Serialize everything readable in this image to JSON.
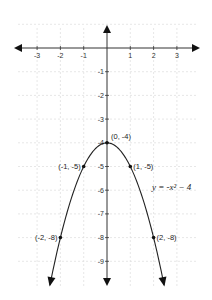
{
  "chart_data": {
    "type": "line",
    "title": "",
    "function_label": "y = -x² − 4",
    "xlabel": "",
    "ylabel": "",
    "xlim": [
      -3.9,
      4.0
    ],
    "ylim": [
      -10.0,
      1.0
    ],
    "grid": true,
    "grid_style": "dashed",
    "x_ticks": [
      -3,
      -2,
      -1,
      1,
      2,
      3
    ],
    "y_ticks": [
      -1,
      -2,
      -3,
      -4,
      -5,
      -6,
      -7,
      -8,
      -9
    ],
    "series": [
      {
        "name": "y = -x^2 - 4",
        "kind": "parabola",
        "a": -1,
        "b": 0,
        "c": -4,
        "x_range": [
          -2.45,
          2.45
        ],
        "arrows_at_ends": true
      }
    ],
    "points": [
      {
        "x": 0,
        "y": -4,
        "label": "(0, -4)"
      },
      {
        "x": -1,
        "y": -5,
        "label": "(-1, -5)"
      },
      {
        "x": 1,
        "y": -5,
        "label": "(1, -5)"
      },
      {
        "x": -2,
        "y": -8,
        "label": "(-2, -8)"
      },
      {
        "x": 2,
        "y": -8,
        "label": "(2, -8)"
      }
    ],
    "axes": {
      "arrows": true,
      "color": "#333333"
    }
  },
  "layout": {
    "origin_px": [
      107,
      48
    ],
    "unit_x_px": 23.3,
    "unit_y_px": 23.7,
    "axis_x_range_px": [
      14,
      200
    ],
    "axis_y_range_px": [
      25,
      286
    ],
    "equation_pos_px": [
      152,
      190
    ],
    "colors": {
      "axis": "#333333",
      "grid": "#dddddd",
      "curve": "#222222",
      "point": "#111111",
      "text": "#333333"
    }
  }
}
